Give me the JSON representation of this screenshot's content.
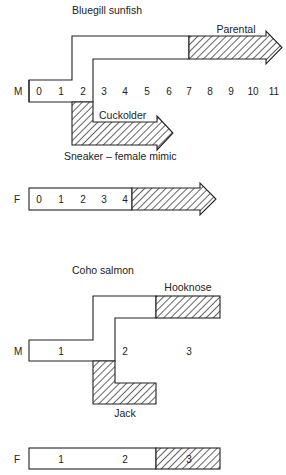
{
  "diagram": {
    "bluegill": {
      "title": "Bluegill sunfish",
      "male": {
        "row_label": "M",
        "ages": [
          "0",
          "1",
          "2",
          "3",
          "4",
          "5",
          "6",
          "7",
          "8",
          "9",
          "10",
          "11"
        ],
        "paths": {
          "parental": "Parental",
          "cuckolder": "Cuckolder",
          "sneaker": "Sneaker – female mimic"
        }
      },
      "female": {
        "row_label": "F",
        "ages": [
          "0",
          "1",
          "2",
          "3",
          "4"
        ]
      }
    },
    "coho": {
      "title": "Coho salmon",
      "male": {
        "row_label": "M",
        "ages": [
          "1",
          "2",
          "3"
        ],
        "paths": {
          "hooknose": "Hooknose",
          "jack": "Jack"
        }
      },
      "female": {
        "row_label": "F",
        "ages": [
          "1",
          "2",
          "3"
        ]
      }
    },
    "legend_note": {
      "hatched": "reproductive phase"
    }
  }
}
